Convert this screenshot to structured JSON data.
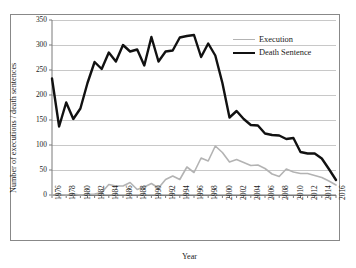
{
  "chart_data": {
    "type": "line",
    "title": "",
    "xlabel": "Year",
    "ylabel": "Number of executions / death sentences",
    "xlim": [
      1976,
      2016
    ],
    "ylim": [
      0,
      350
    ],
    "y_ticks": [
      0,
      50,
      100,
      150,
      200,
      250,
      300,
      350
    ],
    "x_ticks": [
      1976,
      1978,
      1980,
      1982,
      1984,
      1986,
      1988,
      1990,
      1992,
      1994,
      1996,
      1998,
      2000,
      2002,
      2004,
      2006,
      2008,
      2010,
      2012,
      2014,
      2016
    ],
    "x": [
      1976,
      1977,
      1978,
      1979,
      1980,
      1981,
      1982,
      1983,
      1984,
      1985,
      1986,
      1987,
      1988,
      1989,
      1990,
      1991,
      1992,
      1993,
      1994,
      1995,
      1996,
      1997,
      1998,
      1999,
      2000,
      2001,
      2002,
      2003,
      2004,
      2005,
      2006,
      2007,
      2008,
      2009,
      2010,
      2011,
      2012,
      2013,
      2014,
      2015,
      2016
    ],
    "grid": true,
    "legend_position": "top-right",
    "series": [
      {
        "name": "Execution",
        "color": "#b3b3b3",
        "line_width": 1.6,
        "values": [
          0,
          1,
          0,
          2,
          0,
          1,
          2,
          5,
          21,
          18,
          18,
          25,
          11,
          16,
          23,
          14,
          31,
          38,
          31,
          56,
          45,
          74,
          68,
          98,
          85,
          66,
          71,
          65,
          59,
          60,
          53,
          42,
          37,
          52,
          46,
          43,
          43,
          39,
          35,
          28,
          20
        ]
      },
      {
        "name": "Death Sentence",
        "color": "#111111",
        "line_width": 2.4,
        "values": [
          233,
          137,
          185,
          152,
          173,
          224,
          266,
          252,
          285,
          267,
          300,
          287,
          291,
          259,
          316,
          267,
          287,
          289,
          315,
          318,
          320,
          276,
          303,
          279,
          224,
          155,
          168,
          152,
          140,
          139,
          123,
          120,
          119,
          112,
          114,
          86,
          83,
          83,
          73,
          52,
          30
        ]
      }
    ]
  },
  "axis": {
    "y_tick_labels": [
      "350",
      "300",
      "250",
      "200",
      "150",
      "100",
      "50",
      "0"
    ],
    "x_tick_labels": [
      "1976",
      "1978",
      "1980",
      "1982",
      "1984",
      "1986",
      "1988",
      "1990",
      "1992",
      "1994",
      "1996",
      "1998",
      "2000",
      "2002",
      "2004",
      "2006",
      "2008",
      "2010",
      "2012",
      "2014",
      "2016"
    ],
    "y_title": "Number of executions / death sentences",
    "x_title": "Year"
  },
  "legend": {
    "items": [
      {
        "label": "Execution"
      },
      {
        "label": "Death Sentence"
      }
    ]
  },
  "colors": {
    "execution": "#b3b3b3",
    "death_sentence": "#111111",
    "grid": "#c8c8c8",
    "axis": "#7a7a7a",
    "frame": "#888888"
  }
}
